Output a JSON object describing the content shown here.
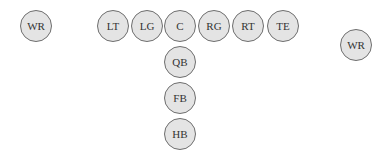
{
  "diagram": {
    "title": "",
    "type": "football-offensive-formation",
    "players": [
      {
        "label": "WR",
        "x": 36,
        "y": 26
      },
      {
        "label": "LT",
        "x": 113,
        "y": 26
      },
      {
        "label": "LG",
        "x": 147,
        "y": 26
      },
      {
        "label": "C",
        "x": 180,
        "y": 26
      },
      {
        "label": "RG",
        "x": 214,
        "y": 26
      },
      {
        "label": "RT",
        "x": 248,
        "y": 26
      },
      {
        "label": "TE",
        "x": 283,
        "y": 26
      },
      {
        "label": "WR",
        "x": 356,
        "y": 45
      },
      {
        "label": "QB",
        "x": 180,
        "y": 62
      },
      {
        "label": "FB",
        "x": 180,
        "y": 98
      },
      {
        "label": "HB",
        "x": 180,
        "y": 134
      }
    ]
  }
}
